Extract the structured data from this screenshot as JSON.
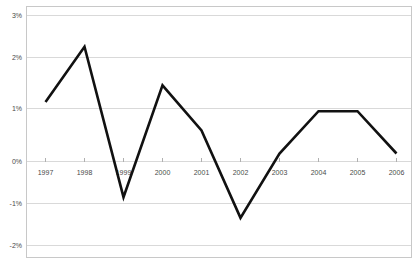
{
  "chart_data": {
    "type": "line",
    "title": "",
    "subtitle": "",
    "xlabel": "",
    "ylabel": "",
    "categories": [
      "1997",
      "1998",
      "1999",
      "2000",
      "2001",
      "2002",
      "2003",
      "2004",
      "2005",
      "2006"
    ],
    "x": [
      1997,
      1998,
      1999,
      2000,
      2001,
      2002,
      2003,
      2004,
      2005,
      2006
    ],
    "values": [
      1.12,
      2.32,
      -0.95,
      1.48,
      0.5,
      -1.4,
      0.0,
      0.92,
      0.92,
      0.0
    ],
    "series": [
      {
        "name": "",
        "values": [
          1.12,
          2.32,
          -0.95,
          1.48,
          0.5,
          -1.4,
          0.0,
          0.92,
          0.92,
          0.0
        ]
      }
    ],
    "ylim": [
      -2,
      3
    ],
    "xlim": [
      "1997",
      "2006"
    ],
    "ytick_values": [
      3,
      2,
      1,
      0,
      -1,
      -2
    ],
    "ytick_labels": [
      "3%",
      "2%",
      "1%",
      "0%",
      "-1%",
      "-2%"
    ],
    "xtick_labels": [
      "1997",
      "1998",
      "1999",
      "2000",
      "2001",
      "2002",
      "2003",
      "2004",
      "2005",
      "2006"
    ],
    "grid": true,
    "grid_axis": "y",
    "legend": false,
    "legend_position": "none",
    "annotations": [],
    "colors": {
      "line": "#111111",
      "grid": "#d9d9d9",
      "frame": "#c8c8c8",
      "tick_text": "#4a4a4a",
      "background": "#ffffff"
    }
  }
}
